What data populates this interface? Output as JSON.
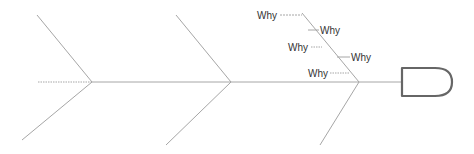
{
  "diagram": {
    "type": "fishbone",
    "colors": {
      "line": "#a6a6a6",
      "head_stroke": "#666666",
      "text": "#333333"
    },
    "why_labels": [
      {
        "label": "Why",
        "x": 257,
        "y": 19
      },
      {
        "label": "Why",
        "x": 310,
        "y": 34
      },
      {
        "label": "Why",
        "x": 288,
        "y": 51
      },
      {
        "label": "Why",
        "x": 329,
        "y": 62
      },
      {
        "label": "Why",
        "x": 308,
        "y": 78
      }
    ]
  }
}
